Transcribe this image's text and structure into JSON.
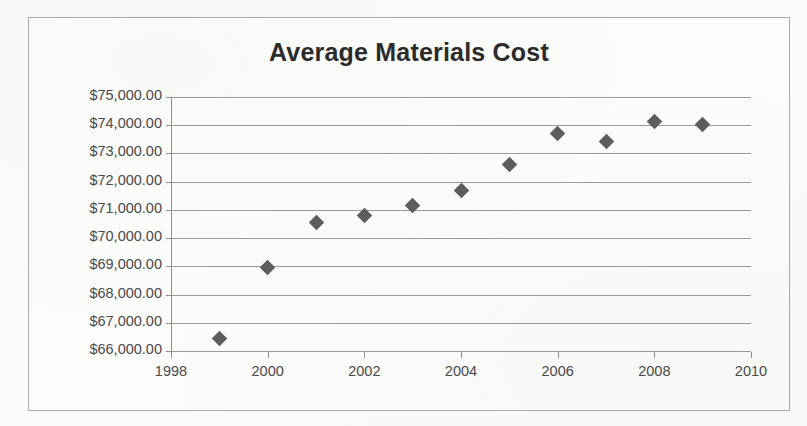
{
  "chart_data": {
    "type": "scatter",
    "title": "Average Materials Cost",
    "xlabel": "",
    "ylabel": "",
    "x": [
      1999,
      2000,
      2001,
      2002,
      2003,
      2004,
      2005,
      2006,
      2007,
      2008,
      2009
    ],
    "values": [
      66460,
      68950,
      70570,
      70790,
      71170,
      71670,
      72600,
      73690,
      73440,
      74120,
      74010
    ],
    "series": [
      {
        "name": "Average Materials Cost",
        "points": [
          {
            "x": 1999,
            "y": 66460
          },
          {
            "x": 2000,
            "y": 68950
          },
          {
            "x": 2001,
            "y": 70570
          },
          {
            "x": 2002,
            "y": 70790
          },
          {
            "x": 2003,
            "y": 71170
          },
          {
            "x": 2004,
            "y": 71670
          },
          {
            "x": 2005,
            "y": 72600
          },
          {
            "x": 2006,
            "y": 73690
          },
          {
            "x": 2007,
            "y": 73440
          },
          {
            "x": 2008,
            "y": 74120
          },
          {
            "x": 2009,
            "y": 74010
          }
        ]
      }
    ],
    "xlim": [
      1998,
      2010
    ],
    "ylim": [
      66000,
      75000
    ],
    "xticks": [
      1998,
      2000,
      2002,
      2004,
      2006,
      2008,
      2010
    ],
    "xtick_labels": [
      "1998",
      "2000",
      "2002",
      "2004",
      "2006",
      "2008",
      "2010"
    ],
    "yticks": [
      66000,
      67000,
      68000,
      69000,
      70000,
      71000,
      72000,
      73000,
      74000,
      75000
    ],
    "ytick_labels": [
      "$66,000.00",
      "$67,000.00",
      "$68,000.00",
      "$69,000.00",
      "$70,000.00",
      "$71,000.00",
      "$72,000.00",
      "$73,000.00",
      "$74,000.00",
      "$75,000.00"
    ],
    "grid": true,
    "grid_axis": "y",
    "legend": false,
    "legend_position": "none",
    "marker_shape": "diamond",
    "colors": {
      "marker": "#5d5d5d",
      "gridline": "#9b9b9b",
      "axis": "#8f8f8f",
      "title": "#2b2b2b",
      "tick_label": "#4a4a4a",
      "border": "#a9a9a9",
      "plot_background": "#fcfcfb",
      "page_background": "#fbfbfa"
    }
  }
}
